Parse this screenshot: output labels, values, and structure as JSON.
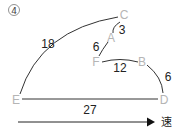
{
  "figure": {
    "label": "④",
    "arrow_label": "速"
  },
  "points": {
    "C": "C",
    "A": "A",
    "F": "F",
    "B": "B",
    "D": "D",
    "E": "E"
  },
  "edges": {
    "EC": "18",
    "CA": "3",
    "AF": "6",
    "FB": "12",
    "BD": "6",
    "ED": "27"
  },
  "colors": {
    "point_label": "#b5b5b5",
    "line": "#333333",
    "text": "#222222"
  }
}
